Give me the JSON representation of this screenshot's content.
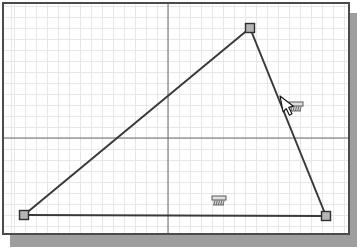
{
  "app": {
    "view": "2d-sketch-graphics-window",
    "description_visible_content": "sketch canvas with grid, axes, rough triangle, constraint symbols and cursor"
  },
  "canvas": {
    "background_color": "#ffffff",
    "border_color": "#4b4b4b",
    "shadow_color": "#9e9e9e",
    "grid": {
      "spacing_px": 11,
      "minor_line_color": "#e7e7e7",
      "axis_line_color": "#6a6a6a",
      "axis_vertical_x": 168,
      "axis_horizontal_y": 138,
      "inner_left": 4,
      "inner_top": 4,
      "inner_right": 348,
      "inner_bottom": 233
    }
  },
  "sketch": {
    "shape": "triangle",
    "line_color": "#3a3a3a",
    "line_width": 2,
    "vertices": [
      {
        "name": "vertex-bottom-left",
        "x": 24,
        "y": 215
      },
      {
        "name": "vertex-top",
        "x": 250,
        "y": 28
      },
      {
        "name": "vertex-bottom-right",
        "x": 326,
        "y": 216
      }
    ],
    "vertex_marker": {
      "size": 9,
      "fill": "#b5b5b5",
      "stroke": "#2f2f2f"
    }
  },
  "constraint_symbols": [
    {
      "name": "horizontal-constraint-symbol",
      "x": 212,
      "y": 196
    },
    {
      "name": "constraint-symbol-at-cursor",
      "x": 289,
      "y": 102
    }
  ],
  "symbol_style": {
    "bar_fill": "#e0e0e0",
    "stroke": "#5a5a5a",
    "hatch_fill": "#d9d9d9"
  },
  "cursor": {
    "type": "arrow-cursor",
    "tip_x": 280,
    "tip_y": 96,
    "fill": "#ffffff",
    "stroke": "#1a1a1a"
  }
}
